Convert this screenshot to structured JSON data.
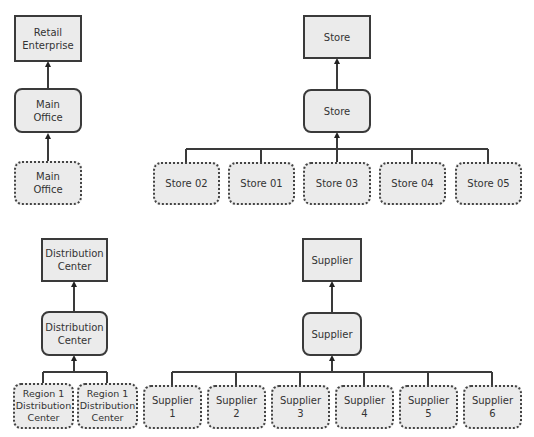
{
  "diagram": {
    "retail": {
      "top": "Retail\nEnterprise",
      "middle": "Main\nOffice",
      "members": [
        "Main\nOffice"
      ]
    },
    "store": {
      "top": "Store",
      "middle": "Store",
      "members": [
        "Store 02",
        "Store 01",
        "Store 03",
        "Store 04",
        "Store 05"
      ]
    },
    "distribution": {
      "top": "Distribution\nCenter",
      "middle": "Distribution\nCenter",
      "members": [
        "Region 1\nDistribution\nCenter",
        "Region 1\nDistribution\nCenter"
      ]
    },
    "supplier": {
      "top": "Supplier",
      "middle": "Supplier",
      "members": [
        "Supplier\n1",
        "Supplier\n2",
        "Supplier\n3",
        "Supplier\n4",
        "Supplier\n5",
        "Supplier\n6"
      ]
    }
  },
  "colors": {
    "node_fill": "#ebebeb",
    "border": "#3a3a3a",
    "text": "#333333"
  }
}
